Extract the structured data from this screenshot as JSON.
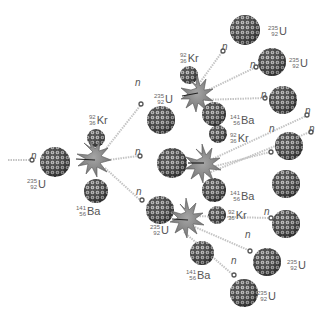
{
  "diagram": {
    "type": "nuclear fission chain reaction",
    "colors": {
      "nucleus_dark": "#3a3a3a",
      "nucleus_light": "#e8e8e8",
      "burst_fill": "#8a8a8a",
      "burst_stroke": "#555555",
      "neutron_fill": "#ffffff",
      "neutron_stroke": "#555555",
      "trail": "#bbbbbb",
      "text": "#555555"
    },
    "neutron_label": "n",
    "isotopes": {
      "u235": {
        "symbol": "U",
        "mass": "235",
        "atomic": "92"
      },
      "kr92": {
        "symbol": "Kr",
        "mass": "92",
        "atomic": "36"
      },
      "ba141": {
        "symbol": "Ba",
        "mass": "141",
        "atomic": "56"
      }
    },
    "generations": [
      {
        "stage": 1,
        "reactant": "U-235",
        "products": [
          "Kr-92",
          "Ba-141",
          "3 n"
        ]
      },
      {
        "stage": 2,
        "fissions": 3,
        "products_each": [
          "Kr-92",
          "Ba-141",
          "neutrons"
        ]
      },
      {
        "stage": 3,
        "new_u235_targets": 9
      }
    ]
  },
  "labels": [
    {
      "id": "n0",
      "kind": "n",
      "x": 31,
      "y": 151
    },
    {
      "id": "u0",
      "kind": "u235",
      "x": 27,
      "y": 178
    },
    {
      "id": "kr0",
      "kind": "kr92",
      "x": 89,
      "y": 114
    },
    {
      "id": "ba0",
      "kind": "ba141",
      "x": 76,
      "y": 205
    },
    {
      "id": "n1a",
      "kind": "n",
      "x": 135,
      "y": 78
    },
    {
      "id": "n1b",
      "kind": "n",
      "x": 135,
      "y": 147
    },
    {
      "id": "n1c",
      "kind": "n",
      "x": 136,
      "y": 187
    },
    {
      "id": "kr1",
      "kind": "kr92",
      "x": 180,
      "y": 52
    },
    {
      "id": "u1",
      "kind": "u235",
      "x": 154,
      "y": 93
    },
    {
      "id": "ba1",
      "kind": "ba141",
      "x": 230,
      "y": 114
    },
    {
      "id": "kr2",
      "kind": "kr92",
      "x": 230,
      "y": 132
    },
    {
      "id": "ba2",
      "kind": "ba141",
      "x": 230,
      "y": 190
    },
    {
      "id": "u3",
      "kind": "u235",
      "x": 150,
      "y": 224
    },
    {
      "id": "kr3",
      "kind": "kr92",
      "x": 228,
      "y": 209
    },
    {
      "id": "ba3",
      "kind": "ba141",
      "x": 186,
      "y": 269
    },
    {
      "id": "un1",
      "kind": "u235",
      "x": 268,
      "y": 25
    },
    {
      "id": "un2",
      "kind": "u235",
      "x": 289,
      "y": 57
    },
    {
      "id": "un7",
      "kind": "u235",
      "x": 287,
      "y": 259
    },
    {
      "id": "un8",
      "kind": "u235",
      "x": 257,
      "y": 290
    },
    {
      "id": "nt1",
      "kind": "n",
      "x": 222,
      "y": 42
    },
    {
      "id": "nt2",
      "kind": "n",
      "x": 250,
      "y": 60
    },
    {
      "id": "nt3",
      "kind": "n",
      "x": 261,
      "y": 90
    },
    {
      "id": "nt4",
      "kind": "n",
      "x": 305,
      "y": 106
    },
    {
      "id": "nt5",
      "kind": "n",
      "x": 269,
      "y": 124
    },
    {
      "id": "nt6",
      "kind": "n",
      "x": 309,
      "y": 124
    },
    {
      "id": "nt7",
      "kind": "n",
      "x": 264,
      "y": 207
    },
    {
      "id": "nt8",
      "kind": "n",
      "x": 245,
      "y": 230
    },
    {
      "id": "nt9",
      "kind": "n",
      "x": 231,
      "y": 256
    }
  ]
}
